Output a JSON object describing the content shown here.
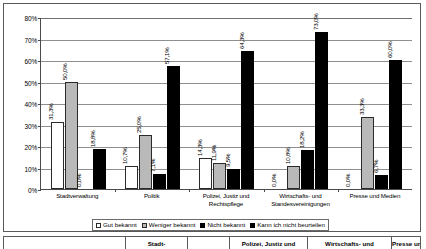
{
  "chart_data": {
    "type": "bar",
    "title": "",
    "xlabel": "",
    "ylabel": "",
    "ylim": [
      0,
      80
    ],
    "grid": true,
    "legend_position": "bottom",
    "yticks": [
      "0%",
      "10%",
      "20%",
      "30%",
      "40%",
      "50%",
      "60%",
      "70%",
      "80%"
    ],
    "ytick_values": [
      0,
      10,
      20,
      30,
      40,
      50,
      60,
      70,
      80
    ],
    "categories": [
      "Stadtverwaltung",
      "Politik",
      "Polizei, Justiz und Rechtspflege",
      "Wirtschafts- und Standesvereinigungen",
      "Presse und Medien"
    ],
    "series": [
      {
        "name": "Gut bekannt",
        "color": "#ffffff",
        "values": [
          31.3,
          10.7,
          14.3,
          0.0,
          0.0
        ],
        "labels": [
          "31,3%",
          "10,7%",
          "14,3%",
          "0,0%",
          "0,0%"
        ]
      },
      {
        "name": "Weniger bekannt",
        "color": "#b9b9b9",
        "values": [
          50.0,
          25.0,
          11.9,
          10.8,
          33.3
        ],
        "labels": [
          "50,0%",
          "25,0%",
          "11,9%",
          "10,8%",
          "33,3%"
        ]
      },
      {
        "name": "Nicht bekannt",
        "color": "#000000",
        "values": [
          0.0,
          7.1,
          9.5,
          18.2,
          6.7
        ],
        "labels": [
          "0,0%",
          "7,1%",
          "9,5%",
          "18,2%",
          "6,7%"
        ]
      },
      {
        "name": "Kann ich nicht beurteilen",
        "color": "#000000",
        "values": [
          18.8,
          57.1,
          64.3,
          73.0,
          60.0
        ],
        "labels": [
          "18,8%",
          "57,1%",
          "64,3%",
          "73,0%",
          "60,0%"
        ]
      }
    ]
  },
  "legend": {
    "items": [
      "Gut bekannt",
      "Weniger bekannt",
      "Nicht bekannt",
      "Kann ich nicht beurteilen"
    ]
  },
  "table": {
    "headers": [
      "",
      "Stadt-",
      "",
      "Polizei, Justiz und",
      "Wirtschafts- und",
      "Presse und"
    ]
  }
}
